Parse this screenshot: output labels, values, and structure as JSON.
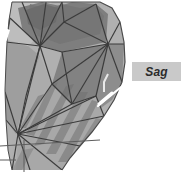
{
  "figure": {
    "kind": "3d-triangulated-mesh-render",
    "background_color": "#ffffff",
    "palette": {
      "mesh_light": "#b4b4b4",
      "mesh_mid": "#9a9a9a",
      "mesh_dark": "#7b7b7b",
      "mesh_darker": "#6a6a6a",
      "wireframe": "#3a3a3a",
      "box_wire": "#585858",
      "leader_line": "#ffffff",
      "label_fill": "#c9c9c9",
      "label_text": "#2b2b2b"
    }
  },
  "annotation": {
    "label": "Sag",
    "style": "italic",
    "box": {
      "x": 132,
      "y": 62,
      "width": 49,
      "height": 19
    },
    "leader": {
      "from_x": 132,
      "from_y": 80,
      "to_x": 100,
      "to_y": 106
    }
  },
  "icons": {
    "leader_line": "leader-line-icon",
    "mesh": "mesh-surface-icon"
  }
}
